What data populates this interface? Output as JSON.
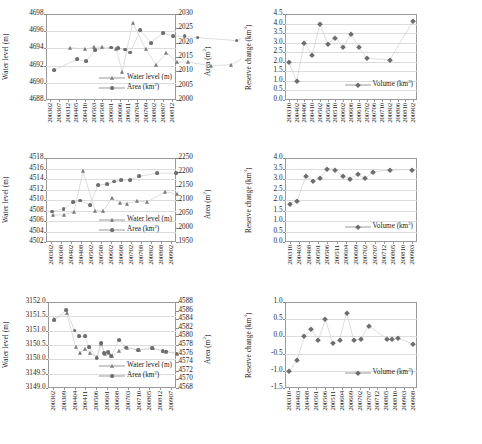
{
  "figure": {
    "panels": [
      "(a)",
      "(b)",
      "(c)",
      "(d)",
      "(e)",
      "(f)"
    ],
    "xlabel": "Time",
    "colors": {
      "marker": "#6d6d6d",
      "line": "#cfcfcf",
      "grid": "#dcdcdc",
      "frame": "#9a9a9a"
    }
  },
  "chart_data": [
    {
      "panel": "(a)",
      "type": "scatter",
      "title": "",
      "xlabel": "Time",
      "ylabel": "Water level (m)",
      "y2label": "Area (m²)",
      "ylim": [
        4688,
        4698
      ],
      "yticks": [
        4688,
        4690,
        4692,
        4694,
        4696,
        4698
      ],
      "y2lim": [
        2000,
        2030
      ],
      "y2ticks": [
        2000,
        2005,
        2010,
        2015,
        2020,
        2025,
        2030
      ],
      "xticks": [
        "200302",
        "200307",
        "200312",
        "200405",
        "200410",
        "200503",
        "200508",
        "200601",
        "200606",
        "200611",
        "200704",
        "200709",
        "200802",
        "200807",
        "200812"
      ],
      "grid": true,
      "legend_position": "inside-bottom-right",
      "series": [
        {
          "name": "Water level (m)",
          "marker": "tri",
          "x": [
            2.3,
            4.0,
            5.0,
            6.0,
            7.6,
            8.3,
            9.5,
            11.0,
            12.2,
            13.4,
            14.6,
            15.9,
            18.5,
            20.9,
            26.4
          ],
          "values": [
            4694.1,
            4693.9,
            4694.15,
            4694.15,
            4693.9,
            4691.3,
            4697.0,
            4693.9,
            4692.1,
            4693.5,
            4692.4,
            4692.4,
            4692.0,
            4692.1,
            4695.4
          ]
        },
        {
          "name": "Area (km²)",
          "marker": "circle",
          "x": [
            0.4,
            3.1,
            4.1,
            5.2,
            7.0,
            7.8,
            8.6,
            9.2,
            10.4,
            11.6,
            13.0,
            14.2,
            15.5,
            17.0,
            21.5,
            26.2
          ],
          "values": [
            4691.45,
            4692.75,
            4692.5,
            4693.8,
            4694.1,
            4694.05,
            4693.85,
            4693.5,
            4696.1,
            4694.65,
            4695.8,
            4695.45,
            4695.4,
            4695.25,
            4694.9,
            4697.0
          ]
        }
      ]
    },
    {
      "panel": "(b)",
      "type": "scatter",
      "xlabel": "Time",
      "ylabel": "Reserve change (km³)",
      "ylim": [
        0.0,
        4.5
      ],
      "yticks": [
        "0.0",
        "0.5",
        "1.0",
        "1.5",
        "2.0",
        "2.5",
        "3.0",
        "3.5",
        "4.0",
        "4.5"
      ],
      "xticks": [
        "200310",
        "200402",
        "200406",
        "200410",
        "200502",
        "200506",
        "200510",
        "200602",
        "200606",
        "200610",
        "200702",
        "200706",
        "200710",
        "200802",
        "200806",
        "200810",
        "200902"
      ],
      "grid": true,
      "legend_position": "inside-bottom-right",
      "series": [
        {
          "name": "Volume (km³)",
          "marker": "diamond",
          "x": [
            0.0,
            1.0,
            2.0,
            3.0,
            4.0,
            5.0,
            6.0,
            7.0,
            8.0,
            9.0,
            10.0,
            13.0,
            16.0
          ],
          "values": [
            1.97,
            1.02,
            3.0,
            2.37,
            3.97,
            2.95,
            3.27,
            2.75,
            3.47,
            2.77,
            2.18,
            2.1,
            4.15
          ]
        }
      ]
    },
    {
      "panel": "(c)",
      "type": "scatter",
      "xlabel": "Time",
      "ylabel": "Water level (m)",
      "y2label": "Area (m²)",
      "ylim": [
        4502,
        4518
      ],
      "yticks": [
        4502,
        4504,
        4506,
        4508,
        4510,
        4512,
        4514,
        4516,
        4518
      ],
      "y2lim": [
        1950,
        2250
      ],
      "y2ticks": [
        1950,
        2000,
        2050,
        2100,
        2150,
        2200,
        2250
      ],
      "xticks": [
        "200302",
        "200308",
        "200402",
        "200408",
        "200502",
        "200508",
        "200602",
        "200608",
        "200702",
        "200708",
        "200802",
        "200808",
        "200902"
      ],
      "grid": true,
      "legend_position": "inside-bottom-right",
      "series": [
        {
          "name": "Water level (m)",
          "marker": "tri",
          "x": [
            0.15,
            1.3,
            2.3,
            3.2,
            4.4,
            5.2,
            6.1,
            6.9,
            7.6,
            8.6,
            9.6,
            11.4,
            12.6
          ],
          "values": [
            4507.1,
            4507.2,
            4507.7,
            4515.5,
            4508.0,
            4507.9,
            4510.4,
            4509.5,
            4509.3,
            4509.8,
            4509.6,
            4511.6,
            4511.1
          ]
        },
        {
          "name": "Area (km²)",
          "marker": "circle",
          "x": [
            0.1,
            1.25,
            2.2,
            2.9,
            3.9,
            4.7,
            5.6,
            6.3,
            7.0,
            7.9,
            8.8,
            10.6,
            12.5
          ],
          "values": [
            4507.8,
            4508.3,
            4509.6,
            4509.9,
            4509.1,
            4512.9,
            4513.0,
            4513.5,
            4513.8,
            4513.85,
            4514.5,
            4515.1,
            4515.1
          ]
        }
      ]
    },
    {
      "panel": "(d)",
      "type": "scatter",
      "xlabel": "Time",
      "ylabel": "Reserve change (km³)",
      "ylim": [
        0.0,
        4.0
      ],
      "yticks": [
        "0.0",
        "0.5",
        "1.0",
        "1.5",
        "2.0",
        "2.5",
        "3.0",
        "3.5",
        "4.0"
      ],
      "xticks": [
        "200310",
        "200403",
        "200408",
        "200501",
        "200506",
        "200511",
        "200604",
        "200609",
        "200702",
        "200707",
        "200712",
        "200805",
        "200810",
        "200903"
      ],
      "grid": true,
      "legend_position": "inside-bottom-right",
      "series": [
        {
          "name": "Volume (km³)",
          "marker": "diamond",
          "x": [
            0.0,
            0.8,
            1.7,
            2.5,
            3.2,
            4.0,
            4.8,
            5.6,
            6.4,
            7.2,
            8.0,
            8.8,
            10.6,
            13.0
          ],
          "values": [
            1.83,
            1.97,
            3.13,
            2.92,
            3.03,
            3.5,
            3.45,
            3.12,
            3.02,
            3.22,
            3.03,
            3.33,
            3.43,
            3.45
          ]
        }
      ]
    },
    {
      "panel": "(e)",
      "type": "scatter",
      "xlabel": "Time",
      "ylabel": "Water level (m)",
      "y2label": "Area (m²)",
      "ylim": [
        3149.0,
        3152.0
      ],
      "yticks": [
        "3149.0",
        "3149.5",
        "3150.0",
        "3150.5",
        "3151.0",
        "3151.5",
        "3152.0"
      ],
      "y2lim": [
        4568,
        4588
      ],
      "y2ticks": [
        4568,
        4570,
        4572,
        4574,
        4576,
        4578,
        4580,
        4582,
        4584,
        4586,
        4588
      ],
      "xticks": [
        "200302",
        "200309",
        "200404",
        "200411",
        "200506",
        "200601",
        "200608",
        "200703",
        "200710",
        "200805",
        "200812",
        "200907"
      ],
      "grid": true,
      "legend_position": "inside-bottom-right",
      "series": [
        {
          "name": "Water level (m)",
          "marker": "tri",
          "x": [
            0.1,
            1.25,
            2.1,
            2.5,
            3.0,
            3.4,
            4.1,
            4.5,
            4.8,
            5.2,
            5.5,
            6.2,
            6.9,
            8.0,
            9.3,
            10.3,
            10.6,
            11.6
          ],
          "values": [
            3151.4,
            3151.6,
            3150.43,
            3150.22,
            3150.35,
            3150.22,
            3150.08,
            3150.55,
            3150.2,
            3150.22,
            3150.1,
            3150.3,
            3150.4,
            3150.33,
            3150.38,
            3150.3,
            3150.27,
            3150.2
          ]
        },
        {
          "name": "Area (km²)",
          "marker": "circle",
          "x": [
            0.05,
            1.2,
            2.0,
            2.45,
            2.95,
            3.35,
            4.05,
            4.45,
            4.75,
            5.15,
            5.45,
            6.15,
            6.85,
            7.95,
            9.25,
            10.25,
            10.55,
            11.55
          ],
          "values": [
            3151.38,
            3151.72,
            3151.0,
            3150.8,
            3150.8,
            3150.43,
            3150.05,
            3150.57,
            3150.23,
            3150.24,
            3150.12,
            3150.68,
            3150.41,
            3150.33,
            3150.38,
            3150.3,
            3150.27,
            3150.2
          ]
        }
      ]
    },
    {
      "panel": "(f)",
      "type": "scatter",
      "xlabel": "Time",
      "ylabel": "Reserve change (km³)",
      "ylim": [
        -1.5,
        1.0
      ],
      "yticks": [
        "-1.5",
        "-1.0",
        "-0.5",
        "0.0",
        "0.5",
        "1.0"
      ],
      "xticks": [
        "200310",
        "200403",
        "200408",
        "200501",
        "200506",
        "200511",
        "200604",
        "200609",
        "200702",
        "200707",
        "200712",
        "200805",
        "200810",
        "200903",
        "200908"
      ],
      "grid": true,
      "legend_position": "inside-bottom-right",
      "series": [
        {
          "name": "Volume (km³)",
          "marker": "diamond",
          "x": [
            0.0,
            0.85,
            1.7,
            2.5,
            3.3,
            4.1,
            4.9,
            5.7,
            6.5,
            7.3,
            8.1,
            9.0,
            11.1,
            11.7,
            12.3,
            14.0
          ],
          "values": [
            -1.0,
            -0.7,
            0.0,
            0.21,
            -0.1,
            0.5,
            -0.2,
            -0.1,
            0.69,
            -0.1,
            -0.09,
            0.31,
            -0.07,
            -0.09,
            -0.05,
            -0.21
          ]
        }
      ]
    }
  ]
}
